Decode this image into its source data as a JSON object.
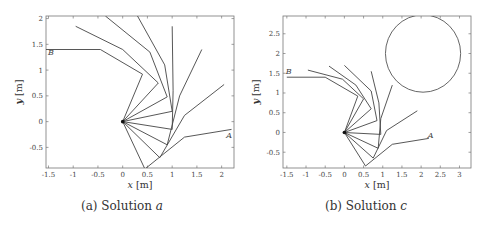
{
  "figure": {
    "panels": [
      {
        "id": "a",
        "caption_prefix": "(a) Solution ",
        "caption_var": "a",
        "xlabel_var": "x",
        "xlabel_unit": " [m]",
        "ylabel_var": "y",
        "ylabel_unit": " [m]",
        "label_A": "A",
        "label_B": "B"
      },
      {
        "id": "c",
        "caption_prefix": "(b) Solution ",
        "caption_var": "c",
        "xlabel_var": "x",
        "xlabel_unit": " [m]",
        "ylabel_var": "y",
        "ylabel_unit": " [m]",
        "label_A": "A",
        "label_B": "B"
      }
    ]
  },
  "chart_data": [
    {
      "type": "line",
      "title": "(a) Solution a",
      "xlabel": "x [m]",
      "ylabel": "y [m]",
      "xlim": [
        -1.55,
        2.25
      ],
      "ylim": [
        -0.9,
        2.05
      ],
      "xticks": [
        -1.5,
        -1,
        -0.5,
        0,
        0.5,
        1,
        1.5,
        2
      ],
      "xtick_labels": [
        "-1.5",
        "-1",
        "-0.5",
        "0",
        "0.5",
        "1",
        "1.5",
        "2"
      ],
      "yticks": [
        -0.5,
        0,
        0.5,
        1,
        1.5,
        2
      ],
      "ytick_labels": [
        "-0.5",
        "0",
        "0.5",
        "1",
        "1.5",
        "2"
      ],
      "grid": false,
      "annotations": [
        {
          "text": "A",
          "x": 2.15,
          "y": -0.32
        },
        {
          "text": "B",
          "x": -1.45,
          "y": 1.3
        }
      ],
      "description": "Snapshots of a 3-link planar manipulator (base at origin) moving from configuration A to configuration B.",
      "series": [
        {
          "name": "config-1 (A)",
          "x": [
            0,
            0.45,
            1.25,
            2.2
          ],
          "y": [
            0,
            -0.92,
            -0.3,
            -0.15
          ]
        },
        {
          "name": "config-2",
          "x": [
            0,
            0.75,
            1.25,
            2.05
          ],
          "y": [
            0,
            -0.7,
            0.12,
            0.72
          ]
        },
        {
          "name": "config-3",
          "x": [
            0,
            0.9,
            1.15,
            1.6
          ],
          "y": [
            0,
            -0.45,
            0.5,
            1.4
          ]
        },
        {
          "name": "config-4",
          "x": [
            0,
            1.0,
            1.02,
            1.0
          ],
          "y": [
            0,
            -0.15,
            0.6,
            1.85
          ]
        },
        {
          "name": "config-5",
          "x": [
            0,
            1.0,
            0.85,
            0.3
          ],
          "y": [
            0,
            0.2,
            1.1,
            2.05
          ]
        },
        {
          "name": "config-6",
          "x": [
            0,
            0.9,
            0.55,
            -0.35
          ],
          "y": [
            0,
            0.48,
            1.35,
            2.05
          ]
        },
        {
          "name": "config-7",
          "x": [
            0,
            0.72,
            0.0,
            -0.95
          ],
          "y": [
            0,
            0.75,
            1.4,
            1.85
          ]
        },
        {
          "name": "config-8 (B)",
          "x": [
            0,
            0.4,
            -0.45,
            -1.55
          ],
          "y": [
            0,
            0.92,
            1.4,
            1.4
          ]
        }
      ]
    },
    {
      "type": "line",
      "title": "(b) Solution c",
      "xlabel": "x [m]",
      "ylabel": "y [m]",
      "xlim": [
        -1.6,
        3.3
      ],
      "ylim": [
        -0.9,
        2.95
      ],
      "xticks": [
        -1.5,
        -1,
        -0.5,
        0,
        0.5,
        1,
        1.5,
        2,
        2.5,
        3
      ],
      "xtick_labels": [
        "-1.5",
        "-1",
        "-0.5",
        "0",
        "0.5",
        "1",
        "1.5",
        "2",
        "2.5",
        "3"
      ],
      "yticks": [
        -0.5,
        0,
        0.5,
        1,
        1.5,
        2,
        2.5
      ],
      "ytick_labels": [
        "-0.5",
        "0",
        "0.5",
        "1",
        "1.5",
        "2",
        "2.5"
      ],
      "grid": false,
      "obstacle": {
        "shape": "circle",
        "center": [
          2.05,
          2.0
        ],
        "radius": 0.98
      },
      "annotations": [
        {
          "text": "A",
          "x": 2.25,
          "y": -0.15
        },
        {
          "text": "B",
          "x": -1.45,
          "y": 1.48
        }
      ],
      "description": "Snapshots of a 3-link planar manipulator moving from A to B while avoiding a circular obstacle.",
      "series": [
        {
          "name": "config-1 (A)",
          "x": [
            0,
            0.55,
            1.25,
            2.2
          ],
          "y": [
            0,
            -0.85,
            -0.3,
            -0.15
          ]
        },
        {
          "name": "config-2",
          "x": [
            0,
            0.75,
            1.1,
            1.9
          ],
          "y": [
            0,
            -0.65,
            0.05,
            0.55
          ]
        },
        {
          "name": "config-3",
          "x": [
            0,
            0.88,
            0.95,
            1.25
          ],
          "y": [
            0,
            -0.4,
            0.35,
            1.2
          ]
        },
        {
          "name": "config-4",
          "x": [
            0,
            0.95,
            0.9,
            0.7
          ],
          "y": [
            0,
            -0.05,
            0.75,
            1.55
          ]
        },
        {
          "name": "config-5",
          "x": [
            0,
            0.85,
            0.7,
            0.0
          ],
          "y": [
            0,
            0.3,
            1.05,
            1.7
          ]
        },
        {
          "name": "config-6",
          "x": [
            0,
            0.7,
            0.3,
            -0.4
          ],
          "y": [
            0,
            0.6,
            1.2,
            1.68
          ]
        },
        {
          "name": "config-7",
          "x": [
            0,
            0.5,
            -0.05,
            -0.95
          ],
          "y": [
            0,
            0.85,
            1.35,
            1.58
          ]
        },
        {
          "name": "config-8 (B)",
          "x": [
            0,
            0.35,
            -0.5,
            -1.5
          ],
          "y": [
            0,
            0.92,
            1.4,
            1.4
          ]
        }
      ]
    }
  ]
}
